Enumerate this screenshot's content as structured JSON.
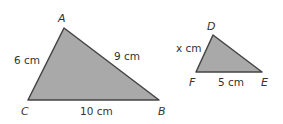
{
  "colors": {
    "fill": "#a9a9a9",
    "stroke": "#444444",
    "text": "#333333"
  },
  "triangle_abc": {
    "vertices": {
      "A": "A",
      "B": "B",
      "C": "C"
    },
    "sides": {
      "AC": "6 cm",
      "AB": "9 cm",
      "CB": "10 cm"
    }
  },
  "triangle_def": {
    "vertices": {
      "D": "D",
      "E": "E",
      "F": "F"
    },
    "sides": {
      "DF": "x cm",
      "FE": "5 cm"
    }
  }
}
